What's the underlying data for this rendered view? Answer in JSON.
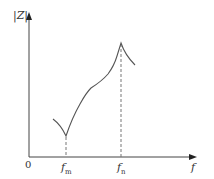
{
  "diagram": {
    "y_axis": {
      "label": "|Z|"
    },
    "x_axis": {
      "label": "f",
      "origin": "0"
    },
    "markers": [
      {
        "name": "f",
        "sub": "m",
        "description": "minimum-impedance frequency"
      },
      {
        "name": "f",
        "sub": "n",
        "description": "maximum-impedance frequency"
      }
    ],
    "colors": {
      "axis": "#444444",
      "curve": "#555555",
      "dash": "#777777",
      "text": "#333333"
    }
  }
}
